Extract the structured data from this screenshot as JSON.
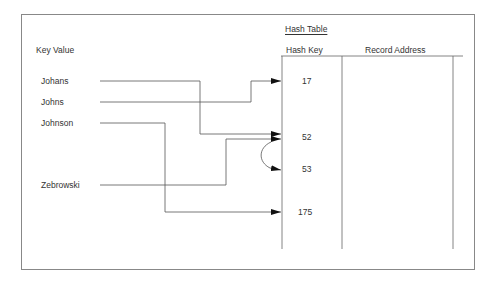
{
  "diagram": {
    "title": "Hash Table",
    "key_column_header": "Key Value",
    "table_headers": [
      "Hash Key",
      "Record Address"
    ],
    "keys": [
      {
        "label": "Johans",
        "maps_to": "52"
      },
      {
        "label": "Johns",
        "maps_to": "17"
      },
      {
        "label": "Johnson",
        "maps_to": "175"
      },
      {
        "label": "Zebrowski",
        "maps_to": "52"
      }
    ],
    "hash_keys": [
      "17",
      "52",
      "53",
      "175"
    ],
    "collision": {
      "from": "52",
      "to": "53"
    }
  }
}
